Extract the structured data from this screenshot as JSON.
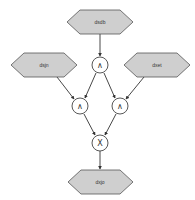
{
  "diagram": {
    "type": "logic-tree",
    "nodes": {
      "top_input": {
        "label": "dsdb",
        "shape": "hexagon"
      },
      "left_input": {
        "label": "dsjn",
        "shape": "hexagon"
      },
      "right_input": {
        "label": "dxet",
        "shape": "hexagon"
      },
      "output": {
        "label": "dxjo",
        "shape": "hexagon"
      },
      "and_top": {
        "label": "∧",
        "shape": "circle"
      },
      "and_left": {
        "label": "∧",
        "shape": "circle"
      },
      "and_right": {
        "label": "∧",
        "shape": "circle"
      },
      "xor_bottom": {
        "label": "X",
        "shape": "circle"
      }
    },
    "edges": [
      {
        "from": "dsdb",
        "to": "and_top"
      },
      {
        "from": "and_top",
        "to": "and_left"
      },
      {
        "from": "and_top",
        "to": "and_right"
      },
      {
        "from": "dsjn",
        "to": "and_left"
      },
      {
        "from": "dxet",
        "to": "and_right"
      },
      {
        "from": "and_left",
        "to": "xor_bottom"
      },
      {
        "from": "and_right",
        "to": "xor_bottom"
      },
      {
        "from": "xor_bottom",
        "to": "dxjo"
      }
    ],
    "colors": {
      "hex_fill": "#cfcfcf",
      "hex_stroke": "#555555",
      "edge": "#333333",
      "circle_fill": "#ffffff"
    }
  }
}
